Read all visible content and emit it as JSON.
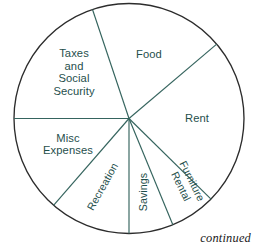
{
  "figure": {
    "footnote": "continued",
    "outline_color": "#2c2c2c",
    "slice_line_color": "#35645e",
    "label_color": "#1f4f4c",
    "background_color": "#ffffff"
  },
  "chart_data": {
    "type": "pie",
    "title": "",
    "subtitle": "",
    "xlabel": "",
    "ylabel": "",
    "legend": "none",
    "grid": false,
    "annotations": [
      "continued"
    ],
    "center": {
      "x": 129,
      "y": 118.5
    },
    "radius": 115,
    "total_degrees": 360,
    "categories": [
      "Food",
      "Rent",
      "Furniture Rental",
      "Savings",
      "Recreation",
      "Misc Expenses",
      "Taxes and Social Security"
    ],
    "values": [
      18.9,
      23.6,
      6.4,
      6.2,
      11.4,
      13.6,
      19.9
    ],
    "slices": [
      {
        "label": "Food",
        "label_lines": [
          "Food"
        ],
        "start_angle": 40.3,
        "end_angle": 108.5,
        "sweep_degrees": 68.2,
        "percent": 18.9,
        "label_x": 149,
        "label_y": 55,
        "label_rotation": 0,
        "label_size": "normal"
      },
      {
        "label": "Rent",
        "label_lines": [
          "Rent"
        ],
        "start_angle": -44.5,
        "end_angle": 40.3,
        "sweep_degrees": 84.8,
        "percent": 23.6,
        "label_x": 197,
        "label_y": 119,
        "label_rotation": 0,
        "label_size": "normal"
      },
      {
        "label": "Furniture Rental",
        "label_lines": [
          "Furniture",
          "Rental"
        ],
        "start_angle": -67.6,
        "end_angle": -44.5,
        "sweep_degrees": 23.1,
        "percent": 6.4,
        "label_x": 186,
        "label_y": 184,
        "label_rotation": 64,
        "label_size": "small"
      },
      {
        "label": "Savings",
        "label_lines": [
          "Savings"
        ],
        "start_angle": -90,
        "end_angle": -67.6,
        "sweep_degrees": 22.4,
        "percent": 6.2,
        "label_x": 144,
        "label_y": 192,
        "label_rotation": -90,
        "label_size": "small"
      },
      {
        "label": "Recreation",
        "label_lines": [
          "Recreation"
        ],
        "start_angle": -131,
        "end_angle": -90,
        "sweep_degrees": 41,
        "percent": 11.4,
        "label_x": 103,
        "label_y": 187,
        "label_rotation": -61,
        "label_size": "small"
      },
      {
        "label": "Misc Expenses",
        "label_lines": [
          "Misc",
          "Expenses"
        ],
        "start_angle": -180,
        "end_angle": -131,
        "sweep_degrees": 49,
        "percent": 13.6,
        "label_x": 68,
        "label_y": 145,
        "label_rotation": 0,
        "label_size": "normal"
      },
      {
        "label": "Taxes and Social Security",
        "label_lines": [
          "Taxes",
          "and",
          "Social",
          "Security"
        ],
        "start_angle": 108.5,
        "end_angle": 180,
        "sweep_degrees": 71.5,
        "percent": 19.9,
        "label_x": 74,
        "label_y": 73,
        "label_rotation": 0,
        "label_size": "normal"
      }
    ]
  }
}
